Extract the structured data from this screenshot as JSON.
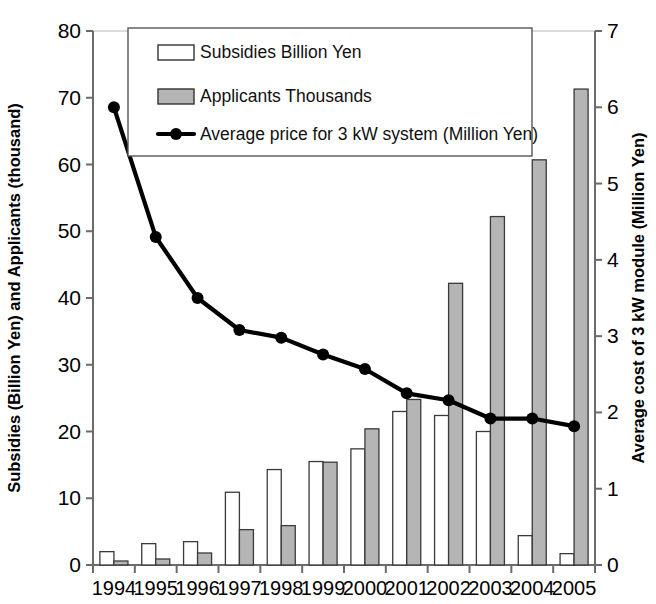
{
  "chart_data": {
    "type": "bar",
    "title": "",
    "subtitle": "",
    "xlabel": "",
    "ylabel": "Subsidies (Billion Yen) and Applicants (thousand)",
    "y2label": "Average cost of 3 kW module (Million Yen)",
    "categories": [
      "1994",
      "1995",
      "1996",
      "1997",
      "1998",
      "1999",
      "2000",
      "2001",
      "2002",
      "2003",
      "2004",
      "2005"
    ],
    "ylim": [
      0,
      80
    ],
    "yticks": [
      0,
      10,
      20,
      30,
      40,
      50,
      60,
      70,
      80
    ],
    "ytick_labels": [
      "0",
      "10",
      "20",
      "30",
      "40",
      "50",
      "60",
      "70",
      "80"
    ],
    "y2lim": [
      0,
      7
    ],
    "y2ticks": [
      0,
      1,
      2,
      3,
      4,
      5,
      6,
      7
    ],
    "y2tick_labels": [
      "0",
      "1",
      "2",
      "3",
      "4",
      "5",
      "6",
      "7"
    ],
    "grid": false,
    "legend_position": "top-center",
    "series": [
      {
        "name": "Subsidies Billion Yen",
        "kind": "bar",
        "axis": "left",
        "fill": "#ffffff",
        "stroke": "#3a3a3a",
        "values": [
          2.0,
          3.2,
          3.5,
          10.9,
          14.3,
          15.5,
          17.4,
          23.0,
          22.4,
          20.0,
          4.4,
          1.7
        ]
      },
      {
        "name": "Applicants Thousands",
        "kind": "bar",
        "axis": "left",
        "fill": "#b5b5b5",
        "stroke": "#3a3a3a",
        "values": [
          0.6,
          0.9,
          1.8,
          5.3,
          5.9,
          15.4,
          20.4,
          24.8,
          42.2,
          52.2,
          60.7,
          71.3
        ]
      },
      {
        "name": "Average price for 3 kW system (Million Yen)",
        "kind": "line",
        "axis": "right",
        "stroke": "#000000",
        "marker": "circle",
        "values": [
          6.0,
          4.3,
          3.5,
          3.08,
          2.98,
          2.76,
          2.57,
          2.25,
          2.16,
          1.92,
          1.92,
          1.82
        ]
      }
    ]
  },
  "legend": {
    "items": [
      {
        "label": "Subsidies Billion Yen",
        "swatch": "open-bar-swatch"
      },
      {
        "label": "Applicants Thousands",
        "swatch": "gray-bar-swatch"
      },
      {
        "label": "Average price for 3 kW system (Million Yen)",
        "swatch": "line-marker-swatch"
      }
    ]
  },
  "colors": {
    "subsidies_fill": "#ffffff",
    "applicants_fill": "#b5b5b5",
    "bar_stroke": "#3a3a3a",
    "line": "#000000",
    "axis": "#6b6b6b",
    "text": "#000000"
  }
}
